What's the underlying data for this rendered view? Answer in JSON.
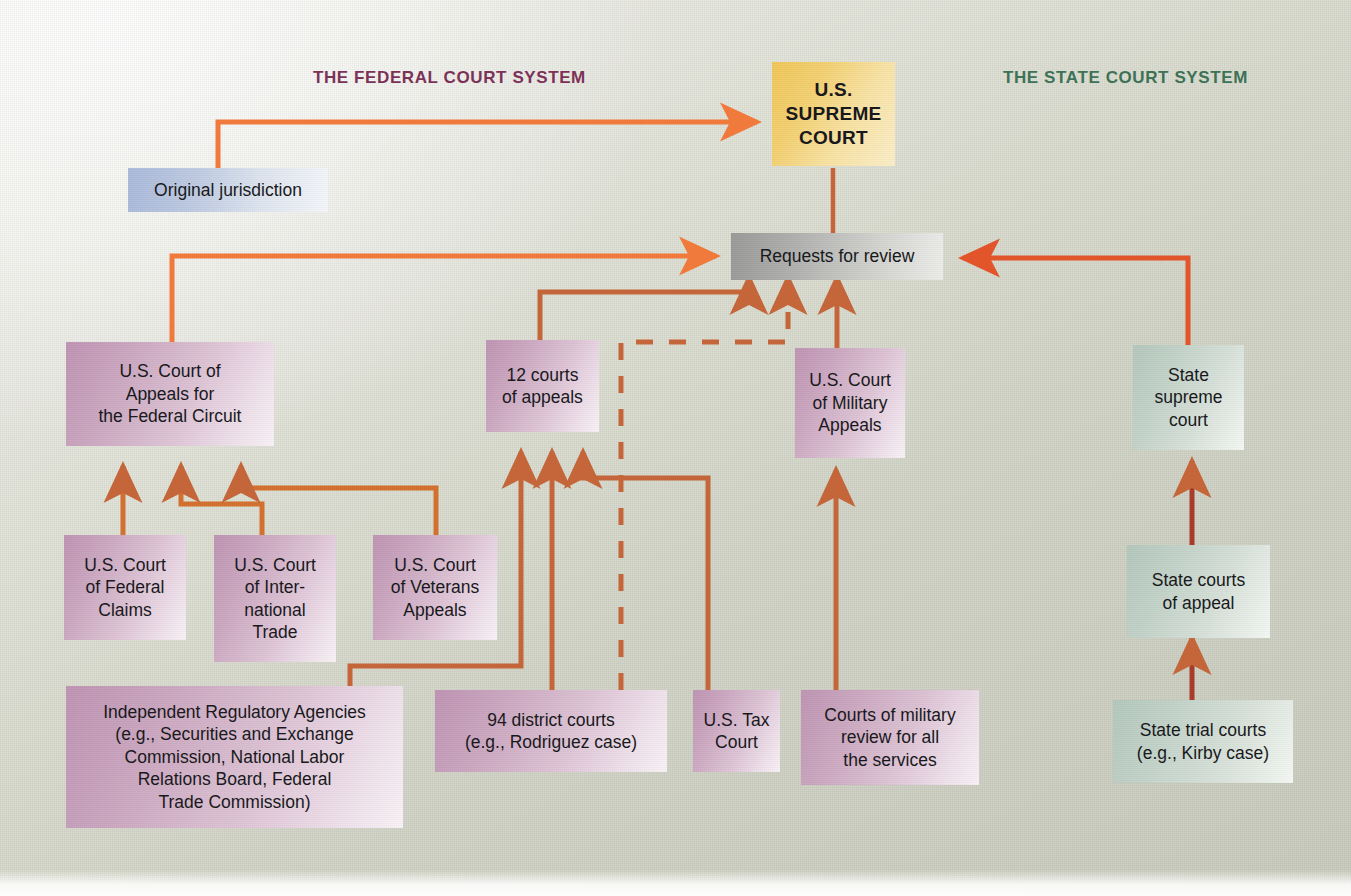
{
  "headers": {
    "federal": "THE FEDERAL COURT SYSTEM",
    "state": "THE STATE COURT SYSTEM"
  },
  "colors": {
    "federal_header": "#7c3258",
    "state_header": "#3d7257",
    "arrow_orange": "#f07a3c",
    "arrow_brown": "#c4663a",
    "supreme_fill": "#f0c75a",
    "federal_box_fill": "#cba7c0",
    "state_box_fill": "#c2d2c8",
    "review_box_fill": "#b2b2b0",
    "original_box_fill": "#bfcbe2",
    "background": "#d9dbd0"
  },
  "nodes": {
    "supreme_court": {
      "label": "U.S.\nSUPREME\nCOURT",
      "lines": [
        "U.S.",
        "SUPREME",
        "COURT"
      ]
    },
    "original_jurisdiction": {
      "label": "Original jurisdiction",
      "lines": [
        "Original jurisdiction"
      ]
    },
    "requests_for_review": {
      "label": "Requests for review",
      "lines": [
        "Requests for review"
      ]
    },
    "federal_circuit": {
      "label": "U.S. Court of Appeals for the Federal Circuit",
      "lines": [
        "U.S. Court of",
        "Appeals for",
        "the Federal Circuit"
      ]
    },
    "courts_of_appeals": {
      "label": "12 courts of appeals",
      "lines": [
        "12 courts",
        "of appeals"
      ]
    },
    "military_appeals": {
      "label": "U.S. Court of Military Appeals",
      "lines": [
        "U.S. Court",
        "of Military",
        "Appeals"
      ]
    },
    "state_supreme_court": {
      "label": "State supreme court",
      "lines": [
        "State",
        "supreme",
        "court"
      ]
    },
    "federal_claims": {
      "label": "U.S. Court of Federal Claims",
      "lines": [
        "U.S. Court",
        "of Federal",
        "Claims"
      ]
    },
    "international_trade": {
      "label": "U.S. Court of International Trade",
      "lines": [
        "U.S. Court",
        "of Inter-",
        "national",
        "Trade"
      ]
    },
    "veterans_appeals": {
      "label": "U.S. Court of Veterans Appeals",
      "lines": [
        "U.S. Court",
        "of Veterans",
        "Appeals"
      ]
    },
    "state_courts_of_appeal": {
      "label": "State courts of appeal",
      "lines": [
        "State courts",
        "of appeal"
      ]
    },
    "regulatory_agencies": {
      "label": "Independent Regulatory Agencies (e.g., Securities and Exchange Commission, National Labor Relations Board, Federal Trade Commission)",
      "lines": [
        "Independent Regulatory Agencies",
        "(e.g., Securities and Exchange",
        "Commission, National Labor",
        "Relations Board, Federal",
        "Trade Commission)"
      ]
    },
    "district_courts": {
      "label": "94 district courts (e.g., Rodriguez case)",
      "lines": [
        "94 district courts",
        "(e.g., Rodriguez case)"
      ]
    },
    "tax_court": {
      "label": "U.S. Tax Court",
      "lines": [
        "U.S. Tax",
        "Court"
      ]
    },
    "military_review_courts": {
      "label": "Courts of military review for all the services",
      "lines": [
        "Courts of military",
        "review for all",
        "the services"
      ]
    },
    "state_trial_courts": {
      "label": "State trial courts (e.g., Kirby case)",
      "lines": [
        "State trial courts",
        "(e.g., Kirby case)"
      ]
    }
  },
  "edges": [
    {
      "name": "original-jurisdiction-to-supreme-court",
      "from": "original_jurisdiction",
      "to": "supreme_court",
      "style": "solid"
    },
    {
      "name": "requests-for-review-to-supreme-court",
      "from": "requests_for_review",
      "to": "supreme_court",
      "style": "solid"
    },
    {
      "name": "federal-circuit-to-requests-for-review",
      "from": "federal_circuit",
      "to": "requests_for_review",
      "style": "solid"
    },
    {
      "name": "courts-of-appeals-to-requests-for-review",
      "from": "courts_of_appeals",
      "to": "requests_for_review",
      "style": "solid"
    },
    {
      "name": "tax-court-dashed-to-requests-for-review",
      "from": "tax_court",
      "to": "requests_for_review",
      "style": "dashed"
    },
    {
      "name": "military-appeals-to-requests-for-review",
      "from": "military_appeals",
      "to": "requests_for_review",
      "style": "solid"
    },
    {
      "name": "state-supreme-court-to-requests-for-review",
      "from": "state_supreme_court",
      "to": "requests_for_review",
      "style": "solid"
    },
    {
      "name": "federal-claims-to-federal-circuit",
      "from": "federal_claims",
      "to": "federal_circuit",
      "style": "solid"
    },
    {
      "name": "international-trade-to-federal-circuit",
      "from": "international_trade",
      "to": "federal_circuit",
      "style": "solid"
    },
    {
      "name": "veterans-appeals-to-federal-circuit",
      "from": "veterans_appeals",
      "to": "federal_circuit",
      "style": "solid"
    },
    {
      "name": "regulatory-agencies-to-federal-circuit",
      "from": "regulatory_agencies",
      "to": "federal_circuit",
      "style": "solid"
    },
    {
      "name": "regulatory-agencies-to-courts-of-appeals",
      "from": "regulatory_agencies",
      "to": "courts_of_appeals",
      "style": "solid"
    },
    {
      "name": "district-courts-to-courts-of-appeals",
      "from": "district_courts",
      "to": "courts_of_appeals",
      "style": "solid"
    },
    {
      "name": "tax-court-to-courts-of-appeals",
      "from": "tax_court",
      "to": "courts_of_appeals",
      "style": "solid"
    },
    {
      "name": "military-review-to-military-appeals",
      "from": "military_review_courts",
      "to": "military_appeals",
      "style": "solid"
    },
    {
      "name": "state-courts-of-appeal-to-state-supreme-court",
      "from": "state_courts_of_appeal",
      "to": "state_supreme_court",
      "style": "solid"
    },
    {
      "name": "state-trial-courts-to-state-courts-of-appeal",
      "from": "state_trial_courts",
      "to": "state_courts_of_appeal",
      "style": "solid"
    }
  ]
}
